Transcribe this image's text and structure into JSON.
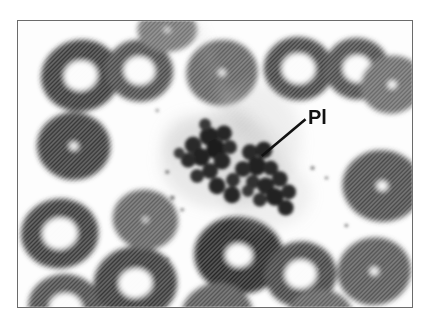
{
  "figure": {
    "kind": "light-microscopy-photomicrograph",
    "frame": {
      "border_color": "#6b6b6b",
      "background_color": "#fdfdfd",
      "x": 17,
      "y": 20,
      "width": 396,
      "height": 288
    },
    "palette": {
      "page_background": "#ffffff",
      "plasma_background": "#fdfdfd",
      "erythrocyte_fill": "#d8d8d8",
      "erythrocyte_rim": "#c4c4c4",
      "central_pallor": "#fbfbfb",
      "platelet_dark": "#2a2a2a",
      "platelet_mid": "#4a4a4a",
      "cytoplasm_haze": "#b9b9b9",
      "label_text": "#111111",
      "leader_line": "#111111"
    },
    "halftone": {
      "enabled": true,
      "angle_deg": 45,
      "pitch_px": 3,
      "stroke_color": "#9a9a9a"
    }
  },
  "annotations": [
    {
      "id": "pl",
      "text": "Pl",
      "meaning": "platelet clump",
      "font_size_px": 20,
      "bold": true,
      "text_x": 308,
      "text_y": 107,
      "leader_from_x": 262,
      "leader_from_y": 156,
      "leader_to_x": 306,
      "leader_to_y": 119
    }
  ],
  "cells": {
    "erythrocytes": [
      {
        "cx": 63,
        "cy": 55,
        "rx": 40,
        "ry": 36,
        "pallor": 0.42,
        "rot": -12,
        "shade": 0.8
      },
      {
        "cx": 122,
        "cy": 50,
        "rx": 34,
        "ry": 31,
        "pallor": 0.46,
        "rot": 8,
        "shade": 0.82
      },
      {
        "cx": 56,
        "cy": 126,
        "rx": 37,
        "ry": 34,
        "pallor": 0.12,
        "rot": 5,
        "shade": 0.8
      },
      {
        "cx": 42,
        "cy": 214,
        "rx": 39,
        "ry": 35,
        "pallor": 0.45,
        "rot": -6,
        "shade": 0.8
      },
      {
        "cx": 48,
        "cy": 289,
        "rx": 38,
        "ry": 34,
        "pallor": 0.44,
        "rot": 10,
        "shade": 0.82
      },
      {
        "cx": 118,
        "cy": 264,
        "rx": 42,
        "ry": 37,
        "pallor": 0.4,
        "rot": -4,
        "shade": 0.8
      },
      {
        "cx": 128,
        "cy": 200,
        "rx": 33,
        "ry": 30,
        "pallor": 0.08,
        "rot": 14,
        "shade": 0.84
      },
      {
        "cx": 205,
        "cy": 52,
        "rx": 36,
        "ry": 33,
        "pallor": 0.1,
        "rot": -10,
        "shade": 0.84
      },
      {
        "cx": 222,
        "cy": 236,
        "rx": 45,
        "ry": 39,
        "pallor": 0.3,
        "rot": 6,
        "shade": 0.78
      },
      {
        "cx": 200,
        "cy": 296,
        "rx": 36,
        "ry": 32,
        "pallor": 0.12,
        "rot": -8,
        "shade": 0.83
      },
      {
        "cx": 282,
        "cy": 48,
        "rx": 35,
        "ry": 32,
        "pallor": 0.48,
        "rot": 4,
        "shade": 0.81
      },
      {
        "cx": 284,
        "cy": 255,
        "rx": 36,
        "ry": 33,
        "pallor": 0.44,
        "rot": -5,
        "shade": 0.81
      },
      {
        "cx": 341,
        "cy": 48,
        "rx": 33,
        "ry": 31,
        "pallor": 0.44,
        "rot": 12,
        "shade": 0.82
      },
      {
        "cx": 376,
        "cy": 64,
        "rx": 32,
        "ry": 29,
        "pallor": 0.14,
        "rot": -14,
        "shade": 0.85
      },
      {
        "cx": 366,
        "cy": 166,
        "rx": 40,
        "ry": 36,
        "pallor": 0.14,
        "rot": 7,
        "shade": 0.82
      },
      {
        "cx": 358,
        "cy": 252,
        "rx": 37,
        "ry": 34,
        "pallor": 0.12,
        "rot": -9,
        "shade": 0.83
      },
      {
        "cx": 304,
        "cy": 300,
        "rx": 34,
        "ry": 30,
        "pallor": 0.1,
        "rot": 3,
        "shade": 0.84
      },
      {
        "cx": 150,
        "cy": 9,
        "rx": 30,
        "ry": 22,
        "pallor": 0.1,
        "rot": 0,
        "shade": 0.86
      }
    ],
    "platelet_clump": {
      "haze": [
        {
          "cx": 205,
          "cy": 140,
          "rx": 62,
          "ry": 48,
          "opacity": 0.3
        },
        {
          "cx": 236,
          "cy": 122,
          "rx": 48,
          "ry": 60,
          "opacity": 0.22
        },
        {
          "cx": 175,
          "cy": 120,
          "rx": 30,
          "ry": 26,
          "opacity": 0.2
        },
        {
          "cx": 250,
          "cy": 175,
          "rx": 44,
          "ry": 34,
          "opacity": 0.22
        }
      ],
      "granules": [
        {
          "cx": 176,
          "cy": 125,
          "r": 8.5,
          "tone": 0.88
        },
        {
          "cx": 192,
          "cy": 116,
          "r": 9.5,
          "tone": 0.95
        },
        {
          "cx": 207,
          "cy": 113,
          "r": 8.0,
          "tone": 0.9
        },
        {
          "cx": 199,
          "cy": 129,
          "r": 10.0,
          "tone": 1.0
        },
        {
          "cx": 184,
          "cy": 137,
          "r": 9.0,
          "tone": 0.93
        },
        {
          "cx": 171,
          "cy": 140,
          "r": 7.5,
          "tone": 0.84
        },
        {
          "cx": 205,
          "cy": 141,
          "r": 8.5,
          "tone": 0.92
        },
        {
          "cx": 193,
          "cy": 151,
          "r": 8.0,
          "tone": 0.88
        },
        {
          "cx": 213,
          "cy": 127,
          "r": 7.0,
          "tone": 0.82
        },
        {
          "cx": 180,
          "cy": 156,
          "r": 7.0,
          "tone": 0.8
        },
        {
          "cx": 200,
          "cy": 166,
          "r": 8.5,
          "tone": 0.9
        },
        {
          "cx": 216,
          "cy": 160,
          "r": 7.0,
          "tone": 0.78
        },
        {
          "cx": 215,
          "cy": 175,
          "r": 8.5,
          "tone": 0.92
        },
        {
          "cx": 233,
          "cy": 132,
          "r": 8.0,
          "tone": 0.87
        },
        {
          "cx": 247,
          "cy": 130,
          "r": 8.5,
          "tone": 0.92
        },
        {
          "cx": 240,
          "cy": 146,
          "r": 9.5,
          "tone": 0.97
        },
        {
          "cx": 226,
          "cy": 149,
          "r": 8.0,
          "tone": 0.86
        },
        {
          "cx": 254,
          "cy": 148,
          "r": 7.5,
          "tone": 0.84
        },
        {
          "cx": 236,
          "cy": 162,
          "r": 7.0,
          "tone": 0.8
        },
        {
          "cx": 249,
          "cy": 166,
          "r": 8.5,
          "tone": 0.91
        },
        {
          "cx": 263,
          "cy": 159,
          "r": 8.0,
          "tone": 0.88
        },
        {
          "cx": 258,
          "cy": 177,
          "r": 9.0,
          "tone": 0.95
        },
        {
          "cx": 272,
          "cy": 172,
          "r": 7.5,
          "tone": 0.85
        },
        {
          "cx": 243,
          "cy": 180,
          "r": 7.0,
          "tone": 0.8
        },
        {
          "cx": 269,
          "cy": 188,
          "r": 8.0,
          "tone": 0.9
        },
        {
          "cx": 231,
          "cy": 171,
          "r": 6.0,
          "tone": 0.72
        },
        {
          "cx": 188,
          "cy": 104,
          "r": 6.0,
          "tone": 0.7
        },
        {
          "cx": 162,
          "cy": 133,
          "r": 5.5,
          "tone": 0.66
        }
      ],
      "smear_streak": [
        {
          "x1": 178,
          "y1": 4,
          "x2": 208,
          "y2": 74,
          "w": 9,
          "opacity": 0.22
        },
        {
          "x1": 208,
          "y1": 74,
          "x2": 226,
          "y2": 112,
          "w": 13,
          "opacity": 0.26
        },
        {
          "x1": 228,
          "y1": 95,
          "x2": 250,
          "y2": 140,
          "w": 16,
          "opacity": 0.2
        }
      ],
      "debris": [
        {
          "cx": 150,
          "cy": 152,
          "r": 2.0
        },
        {
          "cx": 155,
          "cy": 178,
          "r": 2.4
        },
        {
          "cx": 165,
          "cy": 190,
          "r": 1.8
        },
        {
          "cx": 296,
          "cy": 148,
          "r": 2.0
        },
        {
          "cx": 310,
          "cy": 158,
          "r": 1.6
        },
        {
          "cx": 150,
          "cy": 240,
          "r": 1.8
        },
        {
          "cx": 212,
          "cy": 215,
          "r": 2.2
        },
        {
          "cx": 330,
          "cy": 206,
          "r": 1.8
        },
        {
          "cx": 140,
          "cy": 90,
          "r": 1.6
        }
      ]
    }
  }
}
